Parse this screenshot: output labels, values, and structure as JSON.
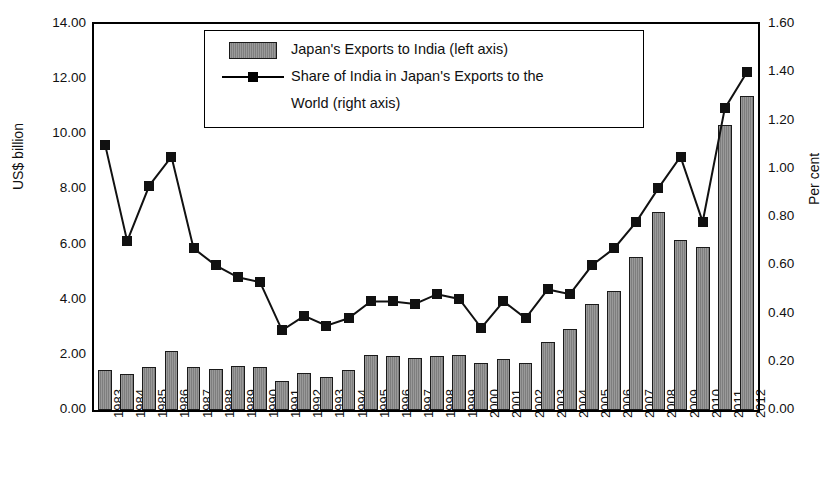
{
  "chart_data": {
    "type": "bar",
    "title": "",
    "xlabel": "",
    "ylabel": "US$ billion",
    "ylabel_right": "Per cent",
    "ylim": [
      0,
      14
    ],
    "ylim_right": [
      0,
      1.6
    ],
    "grid": false,
    "legend_position": "top-center",
    "categories": [
      "1983",
      "1984",
      "1985",
      "1986",
      "1987",
      "1988",
      "1989",
      "1990",
      "1991",
      "1992",
      "1993",
      "1994",
      "1995",
      "1996",
      "1997",
      "1998",
      "1999",
      "2000",
      "2001",
      "2002",
      "2003",
      "2004",
      "2005",
      "2006",
      "2007",
      "2008",
      "2009",
      "2010",
      "2011",
      "2012"
    ],
    "yticks_left": [
      "0.00",
      "2.00",
      "4.00",
      "6.00",
      "8.00",
      "10.00",
      "12.00",
      "14.00"
    ],
    "yticks_right": [
      "0.00",
      "0.20",
      "0.40",
      "0.60",
      "0.80",
      "1.00",
      "1.20",
      "1.40",
      "1.60"
    ],
    "series": [
      {
        "name": "Japan's Exports to India (left axis)",
        "type": "bar",
        "axis": "left",
        "unit": "US$ billion",
        "values": [
          1.45,
          1.3,
          1.55,
          2.15,
          1.55,
          1.5,
          1.6,
          1.55,
          1.05,
          1.35,
          1.2,
          1.45,
          2.0,
          1.95,
          1.9,
          1.95,
          2.0,
          1.7,
          1.85,
          1.7,
          2.45,
          2.95,
          3.85,
          4.3,
          5.55,
          7.2,
          6.15,
          5.9,
          10.35,
          11.4
        ]
      },
      {
        "name": "Share of India in Japan's Exports to the World (right axis)",
        "type": "line",
        "axis": "right",
        "unit": "Per cent",
        "values": [
          1.1,
          0.7,
          0.93,
          1.05,
          0.67,
          0.6,
          0.55,
          0.53,
          0.33,
          0.39,
          0.35,
          0.38,
          0.45,
          0.45,
          0.44,
          0.48,
          0.46,
          0.34,
          0.45,
          0.38,
          0.5,
          0.48,
          0.6,
          0.67,
          0.78,
          0.92,
          1.05,
          0.78,
          1.25,
          1.4
        ]
      }
    ]
  },
  "legend": {
    "entries": [
      {
        "label": "Japan's Exports to India (left axis)",
        "key": "bar-swatch"
      },
      {
        "label": "Share of India in Japan's Exports to the",
        "key": "line-marker-swatch"
      },
      {
        "label": "World (right axis)",
        "key": ""
      }
    ]
  },
  "axes": {
    "left_title": "US$ billion",
    "right_title": "Per cent"
  },
  "colors": {
    "bar_fill": "#8c8c8c",
    "bar_edge": "#1a1a1a",
    "line": "#111111",
    "axis": "#000000",
    "background": "#ffffff"
  }
}
